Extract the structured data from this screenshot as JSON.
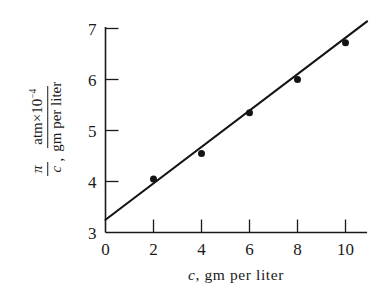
{
  "chart_data": {
    "type": "scatter",
    "title": "",
    "xlabel_parts": {
      "symbol": "c",
      "rest": ", gm  per  liter"
    },
    "ylabel_parts": {
      "symbol": "π",
      "symbol_den": "c",
      "comma": ",",
      "numerator": "atm",
      "numerator_times": "×",
      "numerator_base": "10",
      "numerator_exponent": "−4",
      "denominator": "gm per liter"
    },
    "x": [
      2,
      4,
      6,
      8,
      10
    ],
    "y": [
      4.05,
      4.55,
      5.35,
      6.0,
      6.72
    ],
    "xticks": [
      0,
      2,
      4,
      6,
      8,
      10
    ],
    "xtick_labels": [
      "0",
      "2",
      "4",
      "6",
      "8",
      "10"
    ],
    "yticks": [
      3,
      4,
      5,
      6,
      7
    ],
    "ytick_labels": [
      "3",
      "4",
      "5",
      "6",
      "7"
    ],
    "xlim": [
      0,
      11.0
    ],
    "ylim": [
      3,
      7
    ],
    "fit_line": {
      "intercept": 3.25,
      "slope": 0.357,
      "x_start": 0,
      "x_end": 10.9
    },
    "grid": false,
    "legend": null,
    "marker_color": "#141414",
    "line_color": "#141414",
    "axis_color": "#1a1a1a"
  }
}
